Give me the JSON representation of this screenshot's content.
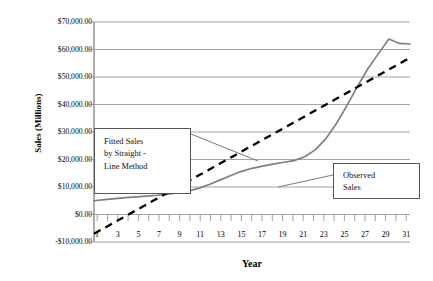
{
  "chart_data": {
    "type": "line",
    "title": "",
    "xlabel": "Year",
    "ylabel": "Sales (Millions)",
    "xlim": [
      1,
      31
    ],
    "ylim": [
      -10000,
      70000
    ],
    "grid": true,
    "legend_position": "inside-right",
    "x": [
      1,
      2,
      3,
      4,
      5,
      6,
      7,
      8,
      9,
      10,
      11,
      12,
      13,
      14,
      15,
      16,
      17,
      18,
      19,
      20,
      21,
      22,
      23,
      24,
      25,
      26,
      27,
      28,
      29,
      30,
      31
    ],
    "xtick_labels": [
      "1",
      "3",
      "5",
      "7",
      "9",
      "11",
      "13",
      "15",
      "17",
      "19",
      "21",
      "23",
      "25",
      "27",
      "29",
      "31"
    ],
    "ytick_labels": [
      "$70,000.00",
      "$60,000.00",
      "$50,000.00",
      "$40,000.00",
      "$30,000.00",
      "$20,000.00",
      "$10,000.00",
      "$0.00",
      "-$10,000.00"
    ],
    "ytick_values": [
      70000,
      60000,
      50000,
      40000,
      30000,
      20000,
      10000,
      0,
      -10000
    ],
    "series": [
      {
        "name": "Observed Sales",
        "style": "solid",
        "color": "#7f7f7f",
        "values": [
          5000,
          5400,
          5800,
          6100,
          6400,
          6700,
          7000,
          7400,
          7900,
          8600,
          9600,
          11000,
          12600,
          14200,
          15700,
          16800,
          17600,
          18300,
          19000,
          19600,
          21000,
          23500,
          27500,
          33000,
          39500,
          46500,
          53000,
          58500,
          63800,
          62200,
          62000
        ]
      },
      {
        "name": "Fitted Sales by Straight-Line Method",
        "style": "dashed",
        "color": "#000000",
        "values": [
          -7000,
          -4870,
          -2730,
          -600,
          1530,
          3670,
          5800,
          7930,
          10070,
          12200,
          14330,
          16470,
          18600,
          20730,
          22870,
          25000,
          27130,
          29270,
          31400,
          33530,
          35670,
          37800,
          39930,
          42070,
          44200,
          46330,
          48470,
          50600,
          52730,
          54870,
          57000
        ]
      }
    ],
    "annotations": [
      {
        "name": "fitted-annotation",
        "lines": [
          "Fitted Sales",
          "by Straight -",
          "Line Method"
        ],
        "points_to": "fitted-trend-line"
      },
      {
        "name": "observed-legend",
        "lines": [
          "Observed",
          "Sales"
        ],
        "points_to": "observed-sales-line"
      }
    ]
  }
}
